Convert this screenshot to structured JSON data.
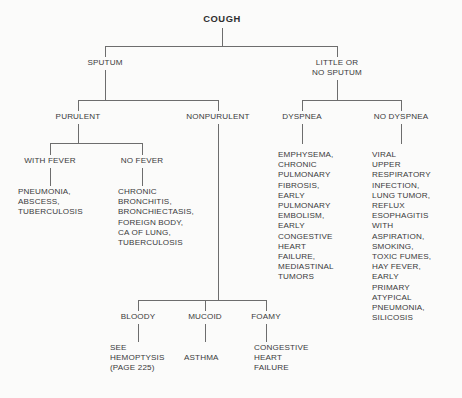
{
  "diagram": {
    "title": "COUGH",
    "type": "flowchart",
    "root": {
      "label": "COUGH",
      "name": "node-cough"
    },
    "level1": [
      {
        "name": "node-sputum",
        "label": "SPUTUM"
      },
      {
        "name": "node-little-or-no-sputum",
        "label": "LITTLE OR\nNO SPUTUM"
      }
    ],
    "level2": [
      {
        "name": "node-purulent",
        "label": "PURULENT"
      },
      {
        "name": "node-nonpurulent",
        "label": "NONPURULENT"
      },
      {
        "name": "node-dyspnea",
        "label": "DYSPNEA"
      },
      {
        "name": "node-no-dyspnea",
        "label": "NO DYSPNEA"
      }
    ],
    "level3": [
      {
        "name": "node-with-fever",
        "label": "WITH FEVER"
      },
      {
        "name": "node-no-fever",
        "label": "NO FEVER"
      },
      {
        "name": "node-bloody",
        "label": "BLOODY"
      },
      {
        "name": "node-mucoid",
        "label": "MUCOID"
      },
      {
        "name": "node-foamy",
        "label": "FOAMY"
      }
    ],
    "leaves": {
      "with_fever": "PNEUMONIA,\nABSCESS,\nTUBERCULOSIS",
      "no_fever": "CHRONIC\nBRONCHITIS,\nBRONCHIECTASIS,\nFOREIGN BODY,\nCA OF LUNG,\nTUBERCULOSIS",
      "dyspnea": "EMPHYSEMA,\nCHRONIC\nPULMONARY\nFIBROSIS,\nEARLY\nPULMONARY\nEMBOLISM,\nEARLY\nCONGESTIVE\nHEART\nFAILURE,\nMEDIASTINAL\nTUMORS",
      "no_dyspnea": "VIRAL\nUPPER\nRESPIRATORY\nINFECTION,\nLUNG TUMOR,\nREFLUX\nESOPHAGITIS\nWITH\nASPIRATION,\nSMOKING,\nTOXIC FUMES,\nHAY FEVER,\nEARLY\nPRIMARY\nATYPICAL\nPNEUMONIA,\nSILICOSIS",
      "bloody": "SEE\nHEMOPTYSIS\n(PAGE 225)",
      "mucoid": "ASTHMA",
      "foamy": "CONGESTIVE\nHEART\nFAILURE"
    },
    "colors": {
      "background": "#fbfbfa",
      "text": "#3a3a3a",
      "title_text": "#2f2f2f",
      "connector": "#6d6d6d"
    }
  }
}
